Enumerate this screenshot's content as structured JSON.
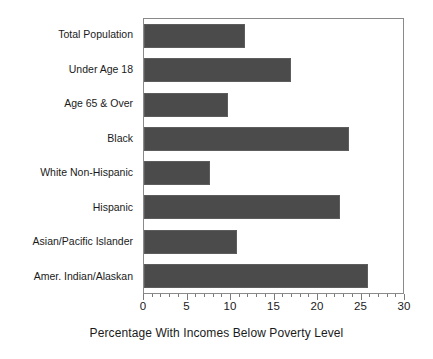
{
  "chart_data": {
    "type": "bar",
    "orientation": "horizontal",
    "title": "",
    "xlabel": "Percentage With Incomes Below Poverty Level",
    "ylabel": "",
    "xlim": [
      0,
      30
    ],
    "xticks": [
      0,
      5,
      10,
      15,
      20,
      25,
      30
    ],
    "xtick_labels": [
      "0",
      "5",
      "10",
      "15",
      "20",
      "25",
      "30"
    ],
    "minor_tick_step": 1,
    "grid": false,
    "legend": false,
    "bar_color": "#4b4b4b",
    "frame_color": "#8a8a8a",
    "background": "#ffffff",
    "categories": [
      "Total Population",
      "Under Age 18",
      "Age 65 & Over",
      "Black",
      "White Non-Hispanic",
      "Hispanic",
      "Asian/Pacific Islander",
      "Amer. Indian/Alaskan"
    ],
    "values": [
      11.7,
      17.0,
      9.7,
      23.7,
      7.7,
      22.7,
      10.8,
      26.0
    ]
  }
}
